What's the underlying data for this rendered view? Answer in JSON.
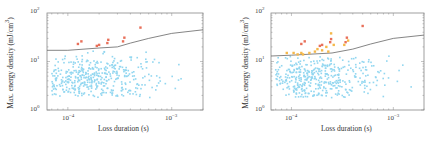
{
  "chart_data": [
    {
      "type": "scatter",
      "title": "",
      "xlabel": "Loss duration (s)",
      "ylabel": "Max. energy density (mJ/cm^3)",
      "xscale": "log",
      "yscale": "log",
      "xlim": [
        6.3e-05,
        0.002
      ],
      "ylim": [
        1,
        100
      ],
      "x_ticks": [
        "10^-4",
        "10^-3"
      ],
      "y_ticks": [
        "10^0",
        "10^1",
        "10^2"
      ],
      "grid": false,
      "legend": null,
      "threshold_line": {
        "x": [
          6.3e-05,
          0.0001,
          0.0002,
          0.0003,
          0.0004,
          0.0006,
          0.001,
          0.002
        ],
        "y": [
          17,
          17,
          19,
          20,
          24,
          30,
          38,
          45
        ],
        "color": "#666666"
      },
      "series": [
        {
          "name": "above threshold",
          "color": "#e8705a",
          "points": [
            [
              0.000125,
              23
            ],
            [
              0.000135,
              26
            ],
            [
              0.00019,
              21
            ],
            [
              0.0002,
              22
            ],
            [
              0.00024,
              24
            ],
            [
              0.000245,
              28
            ],
            [
              0.00034,
              26
            ],
            [
              0.00035,
              31
            ],
            [
              0.0005,
              50
            ]
          ]
        },
        {
          "name": "below threshold",
          "color": "#7fd0ee",
          "approx_count": 420,
          "x_range": [
            7e-05,
            0.0016
          ],
          "y_range": [
            1.8,
            17
          ],
          "density_center": {
            "x": 0.00016,
            "y": 4.5
          }
        }
      ]
    },
    {
      "type": "scatter",
      "title": "",
      "xlabel": "Loss duration (s)",
      "ylabel": "Max. energy density (mJ/cm^3)",
      "xscale": "log",
      "yscale": "log",
      "xlim": [
        6.3e-05,
        0.002
      ],
      "ylim": [
        1,
        100
      ],
      "x_ticks": [
        "10^-4",
        "10^-3"
      ],
      "y_ticks": [
        "10^0",
        "10^1",
        "10^2"
      ],
      "grid": false,
      "legend": null,
      "threshold_line": {
        "x": [
          6.3e-05,
          0.0001,
          0.00025,
          0.0004,
          0.0006,
          0.001,
          0.002
        ],
        "y": [
          13,
          13.5,
          15,
          18,
          23,
          30,
          35
        ],
        "color": "#666666"
      },
      "series": [
        {
          "name": "above threshold (red)",
          "color": "#e8705a",
          "points": [
            [
              0.000125,
              23
            ],
            [
              0.000135,
              26
            ],
            [
              0.00019,
              21
            ],
            [
              0.0002,
              22
            ],
            [
              0.00024,
              25
            ],
            [
              0.000245,
              29
            ],
            [
              0.00034,
              25
            ],
            [
              0.00035,
              31
            ],
            [
              0.0005,
              54
            ]
          ]
        },
        {
          "name": "above threshold (orange)",
          "color": "#f5b84a",
          "points": [
            [
              9e-05,
              15
            ],
            [
              0.000105,
              15
            ],
            [
              0.000115,
              14
            ],
            [
              0.000125,
              15
            ],
            [
              0.00013,
              14
            ],
            [
              0.00015,
              15
            ],
            [
              0.00017,
              16
            ],
            [
              0.00018,
              18
            ],
            [
              0.0002,
              17
            ],
            [
              0.00022,
              20
            ],
            [
              0.00023,
              16
            ],
            [
              0.000245,
              38
            ],
            [
              0.00026,
              22
            ],
            [
              0.00033,
              22
            ],
            [
              0.00036,
              27
            ]
          ]
        },
        {
          "name": "below threshold",
          "color": "#7fd0ee",
          "approx_count": 420,
          "x_range": [
            7e-05,
            0.0016
          ],
          "y_range": [
            1.8,
            13
          ],
          "density_center": {
            "x": 0.00016,
            "y": 4.5
          }
        }
      ]
    }
  ],
  "panels": [
    {
      "ylabel": "Max. energy density (mJ/cm",
      "ylabel_sup": "3",
      "ylabel_end": ")",
      "xlabel": "Loss duration (s)",
      "yticks": [
        {
          "base": "10",
          "exp": "2"
        },
        {
          "base": "10",
          "exp": "1"
        },
        {
          "base": "10",
          "exp": "0"
        }
      ],
      "xticks": [
        {
          "base": "10",
          "exp": "−4"
        },
        {
          "base": "10",
          "exp": "−3"
        }
      ]
    },
    {
      "ylabel": "Max. energy density (mJ/cm",
      "ylabel_sup": "3",
      "ylabel_end": ")",
      "xlabel": "Loss duration (s)",
      "yticks": [
        {
          "base": "10",
          "exp": "2"
        },
        {
          "base": "10",
          "exp": "1"
        },
        {
          "base": "10",
          "exp": "0"
        }
      ],
      "xticks": [
        {
          "base": "10",
          "exp": "−4"
        },
        {
          "base": "10",
          "exp": "−3"
        }
      ]
    }
  ],
  "colors": {
    "frame": "#888888",
    "threshold": "#666666",
    "blue": "#7fd0ee",
    "red": "#e8705a",
    "orange": "#f5b84a"
  }
}
